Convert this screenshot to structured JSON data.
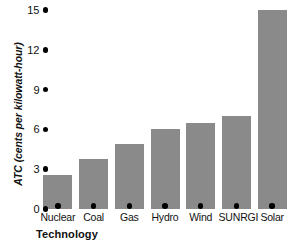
{
  "chart_data": {
    "type": "bar",
    "title": "",
    "categories": [
      "Nuclear",
      "Coal",
      "Gas",
      "Hydro",
      "Wind",
      "SUNRGI",
      "Solar"
    ],
    "values": [
      2.6,
      3.8,
      4.9,
      6.0,
      6.5,
      7.0,
      15.0
    ],
    "xlabel": "Technology",
    "ylabel": "ATC (cents per kilowatt-hour)",
    "ylim": [
      0,
      15
    ],
    "yticks": [
      "0",
      "3",
      "6",
      "9",
      "12",
      "15"
    ],
    "ytick_values": [
      0,
      3,
      6,
      9,
      12,
      15
    ],
    "grid": false,
    "legend": "none",
    "bar_color": "#8a8a8a",
    "tick_marker": "filled-dot",
    "axis_text_color": "#111111"
  }
}
